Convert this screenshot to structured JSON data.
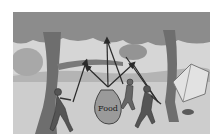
{
  "illustration": {
    "description": "Three people pulling ropes to hoist a food bag between two trees at a campsite",
    "bag_label": "Food",
    "colors": {
      "frame_bg": "#ffffff",
      "sky": "#d6d6d6",
      "ground": "#cfcfcf",
      "foliage": "#8c8c8c",
      "trunk": "#6e6e6e",
      "rope": "#2a2a2a",
      "bag": "#9a9a9a"
    },
    "elements": [
      "left-tree",
      "right-tree",
      "background-bush",
      "tent",
      "campfire",
      "person-left",
      "person-middle",
      "person-right",
      "food-bag",
      "ropes-with-arrows"
    ]
  }
}
